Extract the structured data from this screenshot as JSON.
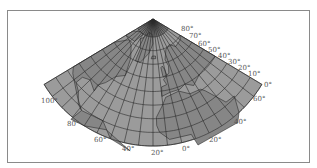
{
  "map": {
    "projection": "conic",
    "colors": {
      "ocean": "#9b9b9b",
      "land": "#868686",
      "grid": "#2a2a2a",
      "coast": "#1a1a1a",
      "label": "#555555",
      "frame": "#8a8a8a"
    },
    "grid": {
      "pole": [
        153,
        19
      ],
      "radius_lat80": 18,
      "radius_lat0": 127,
      "center_lon": -20,
      "lon_min": -110,
      "lon_max": 70,
      "fan_half_angle_deg": 59,
      "lat_step": 10,
      "lon_step": 10
    },
    "latitude_labels": [
      {
        "text": "80°",
        "x": 181,
        "y": 31
      },
      {
        "text": "70°",
        "x": 189,
        "y": 38
      },
      {
        "text": "60°",
        "x": 198,
        "y": 46
      },
      {
        "text": "50°",
        "x": 208,
        "y": 52
      },
      {
        "text": "40°",
        "x": 218,
        "y": 58
      },
      {
        "text": "30°",
        "x": 228,
        "y": 64
      },
      {
        "text": "20°",
        "x": 238,
        "y": 70
      },
      {
        "text": "10°",
        "x": 248,
        "y": 76
      },
      {
        "text": "0°",
        "x": 264,
        "y": 87
      }
    ],
    "longitude_labels": [
      {
        "text": "100°",
        "x": 41,
        "y": 103
      },
      {
        "text": "80°",
        "x": 67,
        "y": 126
      },
      {
        "text": "60°",
        "x": 94,
        "y": 142
      },
      {
        "text": "40°",
        "x": 122,
        "y": 151
      },
      {
        "text": "20°",
        "x": 151,
        "y": 155
      },
      {
        "text": "0°",
        "x": 182,
        "y": 151
      },
      {
        "text": "20°",
        "x": 209,
        "y": 142
      },
      {
        "text": "40°",
        "x": 234,
        "y": 124
      },
      {
        "text": "60°",
        "x": 253,
        "y": 101
      }
    ]
  }
}
